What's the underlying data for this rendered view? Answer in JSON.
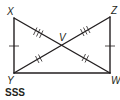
{
  "figure": {
    "type": "geometry-diagram",
    "caption": "SSS",
    "points": {
      "X": {
        "label": "X",
        "x": 14,
        "y": 18
      },
      "Z": {
        "label": "Z",
        "x": 110,
        "y": 17
      },
      "Y": {
        "label": "Y",
        "x": 14,
        "y": 73
      },
      "W": {
        "label": "W",
        "x": 110,
        "y": 73
      },
      "V": {
        "label": "V",
        "x": 62,
        "y": 45
      }
    },
    "segments": [
      {
        "from": "X",
        "to": "Y",
        "ticks": 1
      },
      {
        "from": "Z",
        "to": "W",
        "ticks": 1
      },
      {
        "from": "Y",
        "to": "W",
        "ticks": 0
      },
      {
        "from": "X",
        "to": "V",
        "ticks": 3
      },
      {
        "from": "V",
        "to": "Z",
        "ticks": 3
      },
      {
        "from": "Y",
        "to": "V",
        "ticks": 2
      },
      {
        "from": "V",
        "to": "W",
        "ticks": 2
      }
    ],
    "colors": {
      "stroke": "#231f20",
      "background": "#ffffff"
    }
  }
}
